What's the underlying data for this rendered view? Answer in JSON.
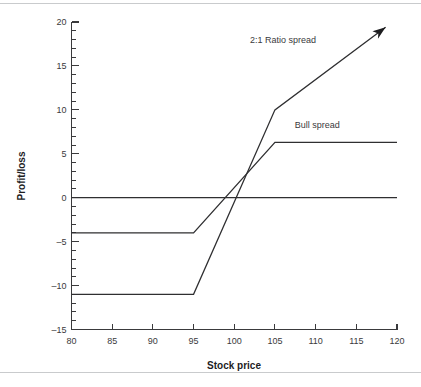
{
  "chart_data": {
    "type": "line",
    "title": "",
    "xlabel": "Stock price",
    "ylabel": "Profit/loss",
    "xlim": [
      80,
      120
    ],
    "ylim": [
      -15,
      20
    ],
    "xticks": [
      80,
      85,
      90,
      95,
      100,
      105,
      110,
      115,
      120
    ],
    "xtick_labels": [
      "80",
      "85",
      "90",
      "95",
      "100",
      "105",
      "110",
      "115",
      "120"
    ],
    "yticks": [
      -15,
      -10,
      -5,
      0,
      5,
      10,
      15,
      20
    ],
    "ytick_labels": [
      "–15",
      "–10",
      "–5",
      "0",
      "5",
      "10",
      "15",
      "20"
    ],
    "y_minor_tick_step": 1,
    "x_minor_ticks": false,
    "grid": false,
    "legend_position": "inline-annotations",
    "series": [
      {
        "name": "Bull spread",
        "label": "Bull spread",
        "label_x": 110.2,
        "label_y": 7.9,
        "x": [
          80,
          95,
          105,
          120
        ],
        "y": [
          -4,
          -4,
          6.3,
          6.3
        ],
        "arrow": false
      },
      {
        "name": "2:1 Ratio spread",
        "label": "2:1 Ratio spread",
        "label_x": 106.0,
        "label_y": 17.6,
        "x": [
          80,
          95,
          105,
          118.6
        ],
        "y": [
          -11,
          -11,
          10,
          19.4
        ],
        "arrow": true
      },
      {
        "name": "zero-line",
        "label": "",
        "x": [
          80,
          120
        ],
        "y": [
          0,
          0
        ],
        "arrow": false
      }
    ]
  },
  "figure": {
    "axis_color": "#3a3a3c",
    "line_color": "#2f2f31",
    "rule_color": "#c9cbcd",
    "background": "#ffffff"
  }
}
